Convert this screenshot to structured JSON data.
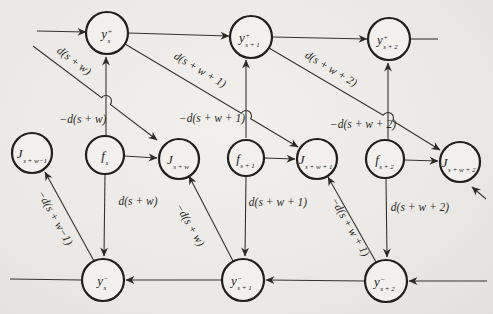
{
  "page": {
    "background": "#ebe9e5",
    "ink": "#2b2924"
  },
  "diagram": {
    "width": 493,
    "height": 314,
    "nodes": [
      {
        "id": "y-plus-s",
        "x": 107,
        "y": 33,
        "r": 21,
        "base": "y",
        "sup": "+",
        "sub": "s"
      },
      {
        "id": "y-plus-s1",
        "x": 251,
        "y": 37,
        "r": 21,
        "base": "y",
        "sup": "+",
        "sub": "s + 1"
      },
      {
        "id": "y-plus-s2",
        "x": 389,
        "y": 39,
        "r": 21,
        "base": "y",
        "sup": "+",
        "sub": "s + 2"
      },
      {
        "id": "j-sw-minus1",
        "x": 32,
        "y": 153,
        "r": 20,
        "base": "J",
        "sub": "s + w−1"
      },
      {
        "id": "f-s",
        "x": 105,
        "y": 155,
        "r": 19,
        "base": "f",
        "sub": "s"
      },
      {
        "id": "j-sw",
        "x": 179,
        "y": 159,
        "r": 20,
        "base": "J",
        "sub": "s + w"
      },
      {
        "id": "f-s1",
        "x": 246,
        "y": 158,
        "r": 18,
        "base": "f",
        "sub": "s + 1"
      },
      {
        "id": "j-sw1",
        "x": 317,
        "y": 159,
        "r": 20,
        "base": "J",
        "sub": "s + w + 1"
      },
      {
        "id": "f-s2",
        "x": 385,
        "y": 159,
        "r": 19,
        "base": "f",
        "sub": "s + 2"
      },
      {
        "id": "j-sw2",
        "x": 460,
        "y": 162,
        "r": 20,
        "base": "J",
        "sub": "s + w + 2"
      },
      {
        "id": "y-minus-s",
        "x": 103,
        "y": 280,
        "r": 21,
        "base": "y",
        "sup": "−",
        "sub": "s"
      },
      {
        "id": "y-minus-s1",
        "x": 243,
        "y": 280,
        "r": 21,
        "base": "y",
        "sup": "−",
        "sub": "s + 1"
      },
      {
        "id": "y-minus-s2",
        "x": 386,
        "y": 281,
        "r": 21,
        "base": "y",
        "sup": "−",
        "sub": "s + 2"
      }
    ],
    "edges": [
      {
        "id": "edge-input-left",
        "from": [
          37,
          31
        ],
        "to": [
          86,
          32
        ],
        "arrow": true
      },
      {
        "id": "edge-yplus-s-to-s1",
        "from": [
          128,
          33
        ],
        "to": [
          229,
          36
        ],
        "arrow": true
      },
      {
        "id": "edge-yplus-s1-to-s2",
        "from": [
          272,
          37
        ],
        "to": [
          367,
          39
        ],
        "arrow": true
      },
      {
        "id": "edge-yplus-s2-out",
        "from": [
          410,
          39
        ],
        "to": [
          438,
          39
        ],
        "arrow": false
      },
      {
        "id": "edge-d-sw-diag",
        "from": [
          33,
          46
        ],
        "to": [
          157,
          140
        ],
        "arrow": true,
        "hop": [
          106,
          101
        ],
        "label": "d(s + w)",
        "label_pos": [
          74,
          61
        ],
        "label_rot": 37
      },
      {
        "id": "edge-d-sw1-diag",
        "from": [
          125,
          44
        ],
        "to": [
          298,
          147
        ],
        "arrow": true,
        "hop": [
          246,
          116
        ],
        "label": "d(s + w + 1)",
        "label_pos": [
          200,
          70
        ],
        "label_rot": 31
      },
      {
        "id": "edge-d-sw2-diag",
        "from": [
          269,
          48
        ],
        "to": [
          440,
          150
        ],
        "arrow": true,
        "hop": [
          388,
          118
        ],
        "label": "d(s + w + 2)",
        "label_pos": [
          331,
          69
        ],
        "label_rot": 31
      },
      {
        "id": "edge-neg-d-sw-up",
        "from": [
          106,
          135
        ],
        "to": [
          106,
          57
        ],
        "arrow": true,
        "label": "−d(s + w)",
        "label_pos": [
          83,
          119
        ],
        "label_rot": 0
      },
      {
        "id": "edge-neg-d-sw1-up",
        "from": [
          246,
          138
        ],
        "to": [
          246,
          60
        ],
        "arrow": true,
        "label": "−d(s + w + 1)",
        "label_pos": [
          212,
          118
        ],
        "label_rot": 0
      },
      {
        "id": "edge-neg-d-sw2-up",
        "from": [
          388,
          139
        ],
        "to": [
          388,
          63
        ],
        "arrow": true,
        "label": "−d(s + w + 2)",
        "label_pos": [
          363,
          124
        ],
        "label_rot": 0
      },
      {
        "id": "edge-f-s-to-j-sw",
        "from": [
          124,
          156
        ],
        "to": [
          157,
          158
        ],
        "arrow": true
      },
      {
        "id": "edge-f-s1-to-j-sw1",
        "from": [
          264,
          158
        ],
        "to": [
          295,
          159
        ],
        "arrow": true
      },
      {
        "id": "edge-f-s2-to-j-sw2",
        "from": [
          404,
          160
        ],
        "to": [
          438,
          161
        ],
        "arrow": true
      },
      {
        "id": "edge-d-sw-down",
        "from": [
          105,
          174
        ],
        "to": [
          104,
          256
        ],
        "arrow": true,
        "label": "d(s + w)",
        "label_pos": [
          138,
          201
        ],
        "label_rot": 0
      },
      {
        "id": "edge-d-sw1-down",
        "from": [
          246,
          176
        ],
        "to": [
          245,
          256
        ],
        "arrow": true,
        "label": "d(s + w + 1)",
        "label_pos": [
          278,
          202
        ],
        "label_rot": 0
      },
      {
        "id": "edge-d-sw2-down",
        "from": [
          386,
          178
        ],
        "to": [
          387,
          257
        ],
        "arrow": true,
        "label": "d(s + w + 2)",
        "label_pos": [
          420,
          207
        ],
        "label_rot": 0
      },
      {
        "id": "edge-input-right",
        "from": [
          487,
          281
        ],
        "to": [
          409,
          281
        ],
        "arrow": true
      },
      {
        "id": "edge-yminus-s2-to-s1",
        "from": [
          365,
          281
        ],
        "to": [
          266,
          280
        ],
        "arrow": true
      },
      {
        "id": "edge-yminus-s1-to-s",
        "from": [
          222,
          280
        ],
        "to": [
          126,
          280
        ],
        "arrow": true
      },
      {
        "id": "edge-yminus-s-out",
        "from": [
          82,
          280
        ],
        "to": [
          10,
          279
        ],
        "arrow": false
      },
      {
        "id": "edge-neg-d-swm1-diag",
        "from": [
          94,
          261
        ],
        "to": [
          45,
          172
        ],
        "arrow": true,
        "label": "−d(s + w−1)",
        "label_pos": [
          55,
          218
        ],
        "label_rot": 61
      },
      {
        "id": "edge-neg-d-sw-diag",
        "from": [
          233,
          261
        ],
        "to": [
          189,
          176
        ],
        "arrow": true,
        "label": "−d(s + w)",
        "label_pos": [
          190,
          225
        ],
        "label_rot": 60
      },
      {
        "id": "edge-neg-d-sw1-diag",
        "from": [
          376,
          262
        ],
        "to": [
          328,
          177
        ],
        "arrow": true,
        "label": "−d(s + w + 1)",
        "label_pos": [
          350,
          227
        ],
        "label_rot": 60
      },
      {
        "id": "edge-neg-d-sw2-diag",
        "from": [
          486,
          199
        ],
        "to": [
          472,
          187
        ],
        "arrow": true
      }
    ]
  }
}
